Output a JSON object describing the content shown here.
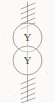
{
  "figure": {
    "kind": "scanned-line-drawing",
    "title": "",
    "background_color": "#fbfaf8",
    "ink_color": "#8d8884",
    "label_color": "#4a4744",
    "width": 55,
    "height": 103
  },
  "axis": {
    "name": "vertical-axis-line",
    "x": 27.5,
    "top_y": 2,
    "bottom_y": 101,
    "stroke_color": "#9a948e",
    "stroke_width": 0.9
  },
  "hatching": {
    "stroke_color": "#8d8884",
    "stroke_width": 0.9,
    "angle_label": "diagonal",
    "top_group": {
      "name": "top-hatch-group",
      "count": 5,
      "y_positions": [
        6,
        11,
        16,
        21,
        26
      ],
      "x_start": 21,
      "x_end": 35,
      "rise": 6
    },
    "bottom_group": {
      "name": "bottom-hatch-group",
      "count": 5,
      "y_positions": [
        78,
        83,
        88,
        93,
        98
      ],
      "x_start": 21,
      "x_end": 35,
      "rise": 6
    }
  },
  "nodes": [
    {
      "name": "upper-node",
      "label": "Y",
      "cx": 27.5,
      "cy": 37.5,
      "r": 14.5,
      "stroke_color": "#9a948e",
      "stroke_width": 0.9
    },
    {
      "name": "lower-node",
      "label": "Y",
      "cx": 27.5,
      "cy": 60.5,
      "r": 14.5,
      "stroke_color": "#9a948e",
      "stroke_width": 0.9
    }
  ],
  "specks": [
    {
      "x": 6,
      "y": 14,
      "size": 1
    },
    {
      "x": 45,
      "y": 9,
      "size": 1
    },
    {
      "x": 9,
      "y": 63,
      "size": 1
    },
    {
      "x": 47,
      "y": 72,
      "size": 1
    },
    {
      "x": 14,
      "y": 95,
      "size": 1
    },
    {
      "x": 41,
      "y": 46,
      "size": 1
    },
    {
      "x": 3,
      "y": 38,
      "size": 1
    },
    {
      "x": 50,
      "y": 90,
      "size": 1
    }
  ]
}
